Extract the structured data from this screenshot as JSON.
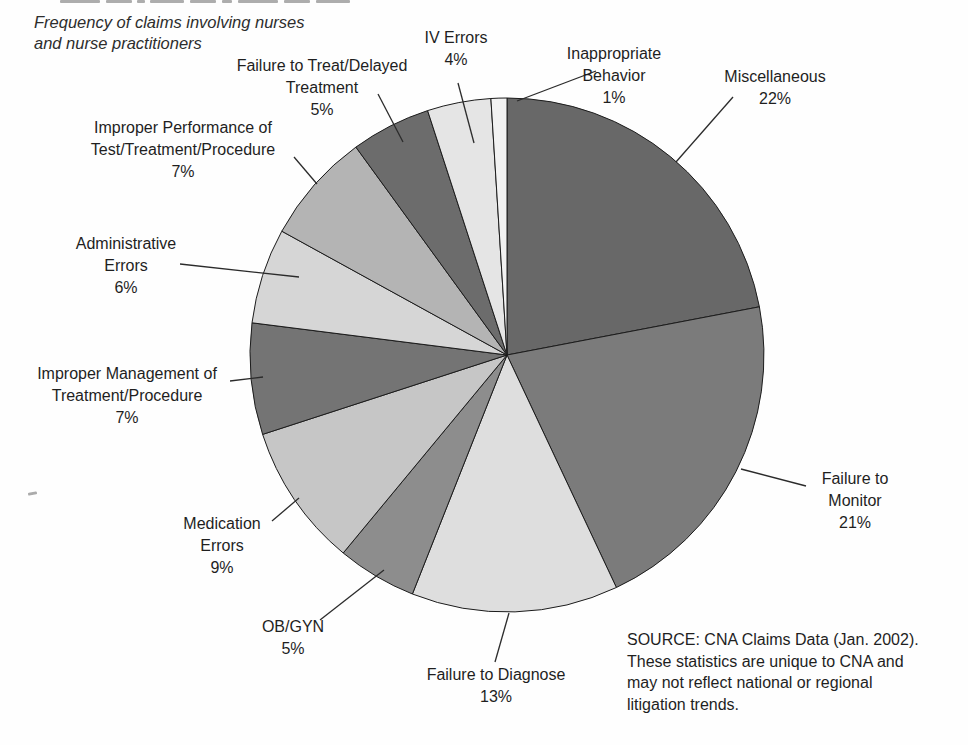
{
  "page": {
    "subtitle_line1": "Frequency of claims involving nurses",
    "subtitle_line2": "and nurse practitioners",
    "source_lines": [
      "SOURCE: CNA Claims Data (Jan. 2002).",
      "These statistics are unique to CNA and",
      "may not reflect national or regional",
      "litigation trends."
    ]
  },
  "chart_data": {
    "type": "pie",
    "title": "Frequency of claims involving nurses and nurse practitioners",
    "source": "SOURCE: CNA Claims Data (Jan. 2002). These statistics are unique to CNA and may not reflect national or regional litigation trends.",
    "units": "percent",
    "total": 100,
    "start_angle": "12 o'clock, clockwise",
    "legend_position": "none (direct labels with leader lines)",
    "slices": [
      {
        "id": "miscellaneous",
        "lines": [
          "Miscellaneous"
        ],
        "pct": "22%",
        "value": 22,
        "color": "#686868"
      },
      {
        "id": "failure-to-monitor",
        "lines": [
          "Failure to",
          "Monitor"
        ],
        "pct": "21%",
        "value": 21,
        "color": "#7b7b7b"
      },
      {
        "id": "failure-to-diagnose",
        "lines": [
          "Failure to Diagnose"
        ],
        "pct": "13%",
        "value": 13,
        "color": "#dedede"
      },
      {
        "id": "ob-gyn",
        "lines": [
          "OB/GYN"
        ],
        "pct": "5%",
        "value": 5,
        "color": "#8d8d8d"
      },
      {
        "id": "medication-errors",
        "lines": [
          "Medication",
          "Errors"
        ],
        "pct": "9%",
        "value": 9,
        "color": "#c6c6c6"
      },
      {
        "id": "improper-management",
        "lines": [
          "Improper Management of",
          "Treatment/Procedure"
        ],
        "pct": "7%",
        "value": 7,
        "color": "#747474"
      },
      {
        "id": "administrative-errors",
        "lines": [
          "Administrative",
          "Errors"
        ],
        "pct": "6%",
        "value": 6,
        "color": "#d6d6d6"
      },
      {
        "id": "improper-performance",
        "lines": [
          "Improper Performance of",
          "Test/Treatment/Procedure"
        ],
        "pct": "7%",
        "value": 7,
        "color": "#b4b4b4"
      },
      {
        "id": "failure-to-treat",
        "lines": [
          "Failure to Treat/Delayed",
          "Treatment"
        ],
        "pct": "5%",
        "value": 5,
        "color": "#6c6c6c"
      },
      {
        "id": "iv-errors",
        "lines": [
          "IV Errors"
        ],
        "pct": "4%",
        "value": 4,
        "color": "#e5e5e5"
      },
      {
        "id": "inappropriate-behavior",
        "lines": [
          "Inappropriate",
          "Behavior"
        ],
        "pct": "1%",
        "value": 1,
        "color": "#f2f2f2"
      }
    ]
  }
}
